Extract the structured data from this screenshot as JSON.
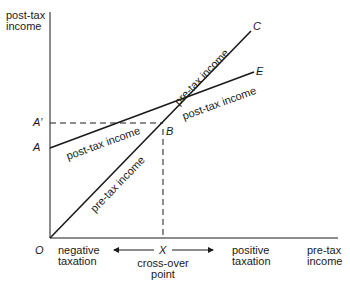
{
  "diagram": {
    "axes": {
      "y_label_line1": "post-tax",
      "y_label_line2": "income",
      "x_label_line1": "pre-tax",
      "x_label_line2": "income"
    },
    "points": {
      "origin": "O",
      "A": "A",
      "A_prime": "A′",
      "B": "B",
      "C": "C",
      "E": "E",
      "X": "X"
    },
    "line_labels": {
      "pre_tax_lower": "pre-tax income",
      "pre_tax_upper": "pre-tax income",
      "post_tax_left": "post-tax income",
      "post_tax_right": "post-tax income"
    },
    "annotations": {
      "negative_line1": "negative",
      "negative_line2": "taxation",
      "positive_line1": "positive",
      "positive_line2": "taxation",
      "crossover_line1": "cross-over",
      "crossover_line2": "point"
    },
    "colors": {
      "ink": "#1a1a1a",
      "background": "#ffffff"
    }
  }
}
